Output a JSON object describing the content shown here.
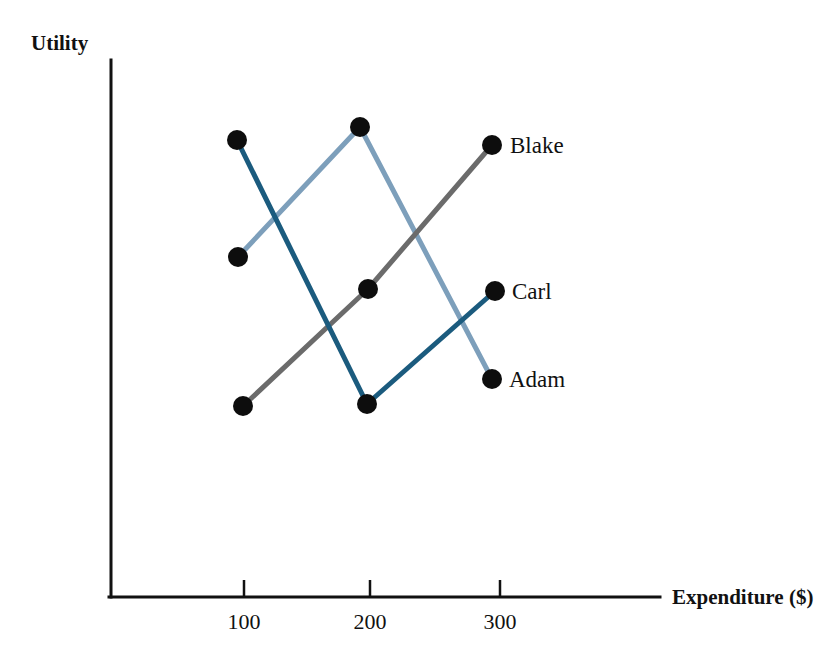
{
  "chart_data": {
    "type": "line",
    "title": "",
    "xlabel": "Expenditure ($)",
    "ylabel": "Utility",
    "x": [
      100,
      200,
      300
    ],
    "xtick_labels": [
      "100",
      "200",
      "300"
    ],
    "ytick_labels": [],
    "xlim": [
      50,
      350
    ],
    "ylim": [
      0,
      100
    ],
    "grid": false,
    "legend_position": "inline-right-of-last-point",
    "series": [
      {
        "name": "Adam",
        "color": "#7d9fbb",
        "values": [
          63,
          85,
          39
        ],
        "points_px": [
          [
            238,
            257
          ],
          [
            360,
            127
          ],
          [
            492,
            379
          ]
        ]
      },
      {
        "name": "Blake",
        "color": "#6b6b6b",
        "values": [
          28,
          54,
          82
        ],
        "points_px": [
          [
            243,
            406
          ],
          [
            368,
            289
          ],
          [
            492,
            145
          ]
        ]
      },
      {
        "name": "Carl",
        "color": "#1b5b7e",
        "values": [
          82,
          28,
          53
        ],
        "points_px": [
          [
            237,
            140
          ],
          [
            367,
            404
          ],
          [
            495,
            291
          ]
        ]
      }
    ]
  },
  "axes": {
    "y_axis_label": "Utility",
    "x_axis_label": "Expenditure ($)",
    "x_ticks": [
      {
        "label": "100",
        "px": 244
      },
      {
        "label": "200",
        "px": 370
      },
      {
        "label": "300",
        "px": 500
      }
    ],
    "origin_px": {
      "x": 111,
      "y": 597
    },
    "y_axis_top_px": 60,
    "x_axis_right_px": 660
  },
  "series_labels": [
    {
      "name": "Blake",
      "x_px": 510,
      "y_px": 153
    },
    {
      "name": "Carl",
      "x_px": 512,
      "y_px": 299
    },
    {
      "name": "Adam",
      "x_px": 509,
      "y_px": 387
    }
  ],
  "colors": {
    "adam": "#7d9fbb",
    "blake": "#6b6b6b",
    "carl": "#1b5b7e",
    "axis": "#111111",
    "marker": "#0d0d0d",
    "background": "#ffffff"
  }
}
